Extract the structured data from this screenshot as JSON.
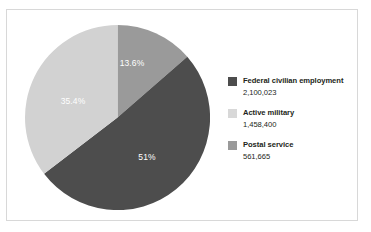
{
  "chart_data": {
    "type": "pie",
    "title": "",
    "subtitle": "",
    "categories": [
      "Federal civilian employment",
      "Active military",
      "Postal service"
    ],
    "values": [
      2100023,
      1458400,
      561665
    ],
    "value_labels": [
      "2,100,023",
      "1,458,400",
      "561,665"
    ],
    "percent_labels": [
      "51%",
      "35.4%",
      "13.6%"
    ],
    "slices": [
      {
        "name": "Postal service",
        "percent_label": "13.6%",
        "percent": 13.6,
        "value": 561665,
        "value_label": "561,665",
        "color": "#9a9a9a",
        "start_angle": 0,
        "end_angle": 48.96,
        "label_x": 132,
        "label_y": 66
      },
      {
        "name": "Federal civilian employment",
        "percent_label": "51%",
        "percent": 51.0,
        "value": 2100023,
        "value_label": "2,100,023",
        "color": "#4d4d4d",
        "start_angle": 48.96,
        "end_angle": 232.56,
        "label_x": 147,
        "label_y": 160
      },
      {
        "name": "Active military",
        "percent_label": "35.4%",
        "percent": 35.4,
        "value": 1458400,
        "value_label": "1,458,400",
        "color": "#d2d2d2",
        "start_angle": 232.56,
        "end_angle": 360,
        "label_x": 73,
        "label_y": 104
      }
    ],
    "legend_position": "right",
    "grid": false
  },
  "legend": {
    "items": [
      {
        "label": "Federal civilian employment",
        "value": "2,100,023",
        "color": "#4d4d4d",
        "swatch_name": "legend-swatch-federal-civilian-employment"
      },
      {
        "label": "Active military",
        "value": "1,458,400",
        "color": "#d8d8d8",
        "swatch_name": "legend-swatch-active-military"
      },
      {
        "label": "Postal service",
        "value": "561,665",
        "color": "#9a9a9a",
        "swatch_name": "legend-swatch-postal-service"
      }
    ]
  },
  "colors": {
    "dark_gray": "#4d4d4d",
    "medium_gray": "#9a9a9a",
    "light_gray": "#d2d2d2",
    "frame_border": "#d8d8d8",
    "text": "#231f20",
    "label_text": "#ffffff",
    "background": "#ffffff"
  }
}
